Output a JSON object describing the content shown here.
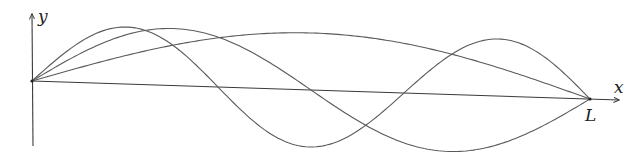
{
  "diagram": {
    "labels": {
      "y_axis": "y",
      "x_axis": "x",
      "end_point": "L"
    },
    "geometry": {
      "origin": [
        32,
        81
      ],
      "end": [
        590,
        99
      ],
      "y_axis_top": [
        32,
        14
      ],
      "y_axis_bottom": [
        33,
        146
      ],
      "x_axis_arrow_end": [
        619,
        100
      ],
      "amplitude_px": 57
    },
    "stroke_color": "#5a5a5a",
    "axis_color": "#3a3a3a",
    "modes": [
      {
        "n": 1,
        "name": "fundamental",
        "amplitude": 1
      },
      {
        "n": 2,
        "name": "second-harmonic",
        "amplitude": 1
      },
      {
        "n": 3,
        "name": "third-harmonic",
        "amplitude": 1
      }
    ]
  },
  "chart_data": {
    "type": "line",
    "title": "",
    "xlabel": "x",
    "ylabel": "y",
    "x_range": [
      0,
      "L"
    ],
    "series": [
      {
        "name": "n=1",
        "function": "sin(pi x / L)",
        "nodes": [
          0,
          "L"
        ],
        "antinodes": [
          "L/2"
        ]
      },
      {
        "name": "n=2",
        "function": "sin(2 pi x / L)",
        "nodes": [
          0,
          "L/2",
          "L"
        ],
        "antinodes": [
          "L/4",
          "3L/4"
        ]
      },
      {
        "name": "n=3",
        "function": "sin(3 pi x / L)",
        "nodes": [
          0,
          "L/3",
          "2L/3",
          "L"
        ],
        "antinodes": [
          "L/6",
          "L/2",
          "5L/6"
        ]
      }
    ],
    "grid": false,
    "legend": "none"
  }
}
